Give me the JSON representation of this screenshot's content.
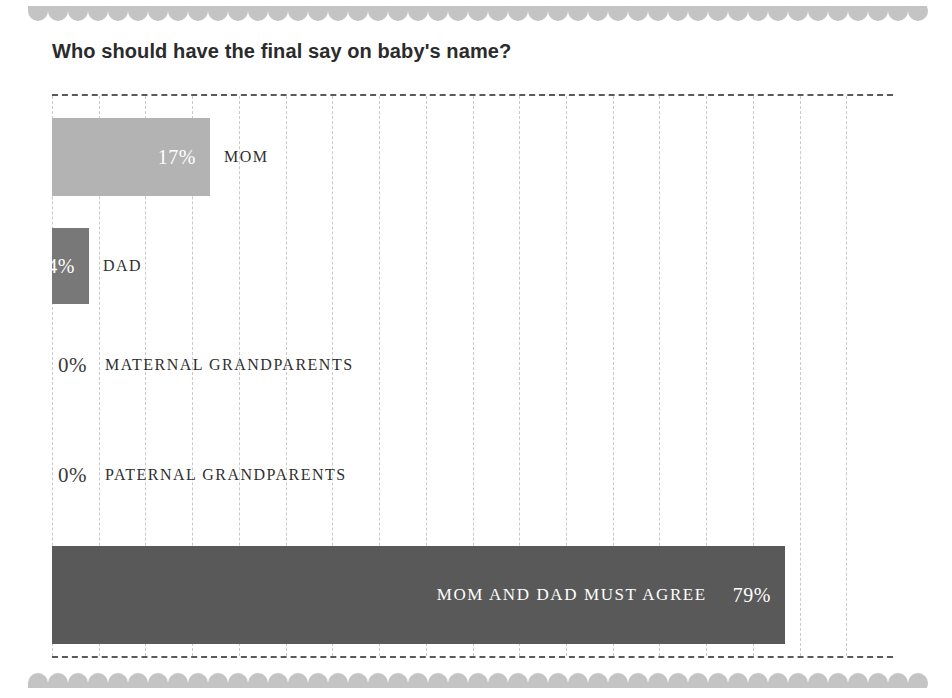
{
  "page": {
    "background_color": "#ffffff",
    "decoration": {
      "top_scallop_name": "scalloped-border-top",
      "bottom_scallop_name": "scalloped-border-bottom",
      "scallop_color": "#c4c4c4"
    }
  },
  "chart_data": {
    "type": "bar",
    "orientation": "horizontal",
    "title": "Who should have the final say on baby's name?",
    "xlabel": "",
    "ylabel": "",
    "xlim": [
      0,
      100
    ],
    "grid": true,
    "gridline_count": 18,
    "legend": "none",
    "categories": [
      "MOM",
      "DAD",
      "MATERNAL GRANDPARENTS",
      "PATERNAL GRANDPARENTS",
      "MOM AND DAD MUST AGREE"
    ],
    "values": [
      17,
      4,
      0,
      0,
      79
    ],
    "value_labels": [
      "17%",
      "4%",
      "0%",
      "0%",
      "79%"
    ],
    "bars": [
      {
        "label": "MOM",
        "value": 17,
        "value_label": "17%",
        "color": "#b3b3b3",
        "label_placement": "outside",
        "value_placement": "inside"
      },
      {
        "label": "DAD",
        "value": 4,
        "value_label": "4%",
        "color": "#787878",
        "label_placement": "outside",
        "value_placement": "inside"
      },
      {
        "label": "MATERNAL GRANDPARENTS",
        "value": 0,
        "value_label": "0%",
        "color": "#b3b3b3",
        "label_placement": "outside",
        "value_placement": "outside"
      },
      {
        "label": "PATERNAL GRANDPARENTS",
        "value": 0,
        "value_label": "0%",
        "color": "#b3b3b3",
        "label_placement": "outside",
        "value_placement": "outside"
      },
      {
        "label": "MOM AND DAD MUST AGREE",
        "value": 79,
        "value_label": "79%",
        "color": "#595959",
        "label_placement": "inside",
        "value_placement": "inside"
      }
    ]
  }
}
